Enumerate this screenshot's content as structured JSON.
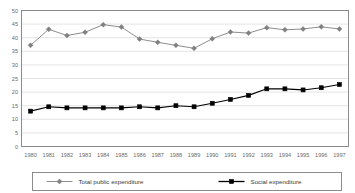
{
  "chart_data": {
    "type": "line",
    "title": "",
    "subtitle": "",
    "xlabel": "",
    "ylabel": "",
    "ylim": [
      0,
      50
    ],
    "yticks": [
      0,
      5,
      10,
      15,
      20,
      25,
      30,
      35,
      40,
      45,
      50
    ],
    "ytick_labels": [
      "0",
      "5",
      "10",
      "15",
      "20",
      "25",
      "30",
      "35",
      "40",
      "45",
      "50"
    ],
    "grid": true,
    "grid_axis": "y",
    "legend_position": "bottom",
    "categories": [
      "1980",
      "1981",
      "1982",
      "1983",
      "1984",
      "1985",
      "1986",
      "1987",
      "1988",
      "1989",
      "1990",
      "1991",
      "1992",
      "1993",
      "1994",
      "1995",
      "1996",
      "1997"
    ],
    "x": [
      "1980",
      "1981",
      "1982",
      "1983",
      "1984",
      "1985",
      "1986",
      "1987",
      "1988",
      "1989",
      "1990",
      "1991",
      "1992",
      "1993",
      "1994",
      "1995",
      "1996",
      "1997"
    ],
    "series": [
      {
        "name": "Total public expenditure",
        "marker": "diamond",
        "color": "#808080",
        "values": [
          37.2,
          43.1,
          40.8,
          42.0,
          44.8,
          43.9,
          39.5,
          38.3,
          37.2,
          36.1,
          39.6,
          42.1,
          41.7,
          43.7,
          42.9,
          43.2,
          44.0,
          43.2
        ]
      },
      {
        "name": "Social expenditure",
        "marker": "square",
        "color": "#000000",
        "values": [
          13.0,
          14.6,
          14.2,
          14.2,
          14.2,
          14.2,
          14.6,
          14.2,
          15.0,
          14.6,
          15.9,
          17.3,
          18.8,
          21.2,
          21.2,
          20.8,
          21.6,
          22.8
        ]
      }
    ],
    "colors": {
      "series_1": "#808080",
      "series_2": "#000000",
      "grid": "#d9d9d9",
      "frame": "#808080",
      "tick_text": "#6a6a6a",
      "legend_text": "#3a3a3a",
      "background": "#ffffff"
    }
  },
  "legend": {
    "entries": [
      {
        "label": "Total public expenditure"
      },
      {
        "label": "Social expenditure"
      }
    ]
  }
}
